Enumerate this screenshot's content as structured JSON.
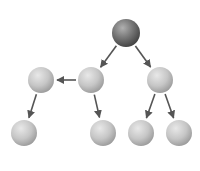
{
  "diagram": {
    "type": "tree",
    "background": "#ffffff",
    "edge_color": "#555555",
    "node_color_root": "#6e6e6e",
    "node_color_default": "#c4c4c4",
    "nodes": [
      {
        "id": "root",
        "x": 126,
        "y": 33,
        "r": 14,
        "style": "dark"
      },
      {
        "id": "n1",
        "x": 41,
        "y": 80,
        "r": 13,
        "style": "light"
      },
      {
        "id": "n2",
        "x": 91,
        "y": 80,
        "r": 13,
        "style": "light"
      },
      {
        "id": "n3",
        "x": 160,
        "y": 80,
        "r": 13,
        "style": "light"
      },
      {
        "id": "n4",
        "x": 24,
        "y": 133,
        "r": 13,
        "style": "light"
      },
      {
        "id": "n5",
        "x": 103,
        "y": 133,
        "r": 13,
        "style": "light"
      },
      {
        "id": "n6",
        "x": 141,
        "y": 133,
        "r": 13,
        "style": "light"
      },
      {
        "id": "n7",
        "x": 179,
        "y": 133,
        "r": 13,
        "style": "light"
      }
    ],
    "edges": [
      {
        "from": "root",
        "to": "n2"
      },
      {
        "from": "root",
        "to": "n3"
      },
      {
        "from": "n2",
        "to": "n1"
      },
      {
        "from": "n1",
        "to": "n4"
      },
      {
        "from": "n2",
        "to": "n5"
      },
      {
        "from": "n3",
        "to": "n6"
      },
      {
        "from": "n3",
        "to": "n7"
      }
    ]
  }
}
